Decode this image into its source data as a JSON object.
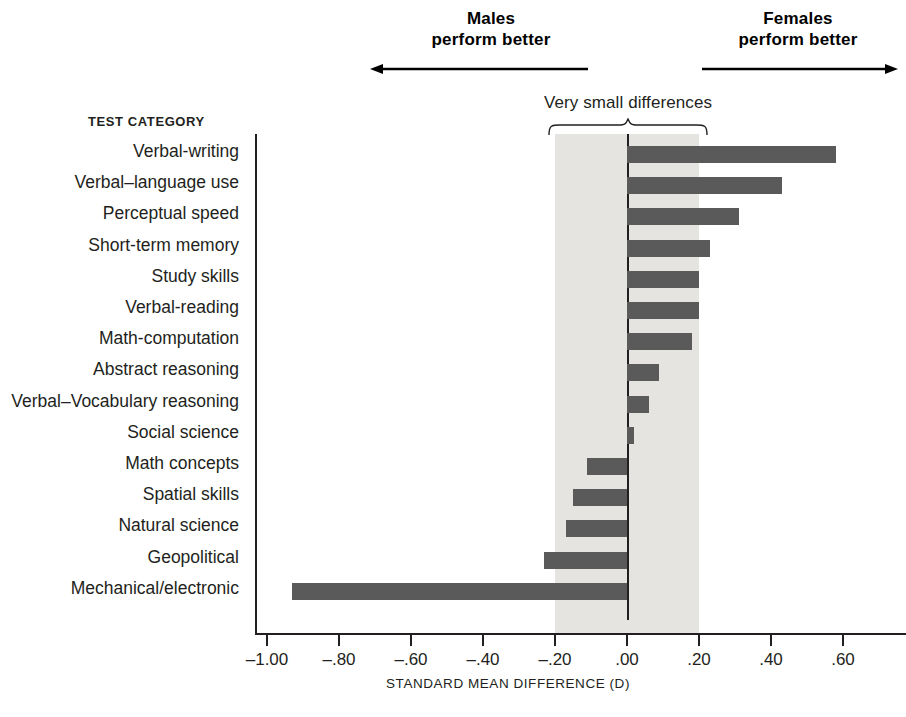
{
  "annotations": {
    "males": {
      "line1": "Males",
      "line2": "perform better",
      "arrow": "left-arrow-icon"
    },
    "females": {
      "line1": "Females",
      "line2": "perform better",
      "arrow": "right-arrow-icon"
    },
    "brace_caption": "Very small differences"
  },
  "axes": {
    "category_header": "TEST CATEGORY",
    "x_title": "STANDARD MEAN DIFFERENCE (D)",
    "x_tick_labels": [
      "–1.00",
      "–.80",
      "–.60",
      "–.40",
      "–.20",
      ".00",
      ".20",
      ".40",
      ".60"
    ]
  },
  "colors": {
    "bar": "#5a5a5a",
    "band": "#e5e4e1",
    "axis": "#231f20",
    "text": "#231f20",
    "background": "#ffffff"
  },
  "chart_data": {
    "type": "bar",
    "orientation": "horizontal",
    "title": "",
    "subtitle": "",
    "xlabel": "STANDARD MEAN DIFFERENCE (D)",
    "ylabel": "TEST CATEGORY",
    "xlim": [
      -1.05,
      0.7
    ],
    "xticks": [
      -1.0,
      -0.8,
      -0.6,
      -0.4,
      -0.2,
      0.0,
      0.2,
      0.4,
      0.6
    ],
    "xtick_labels": [
      "–1.00",
      "–.80",
      "–.60",
      "–.40",
      "–.20",
      ".00",
      ".20",
      ".40",
      ".60"
    ],
    "grid": false,
    "legend": null,
    "shaded_band": {
      "from": -0.2,
      "to": 0.2,
      "label": "Very small differences"
    },
    "annotations": [
      {
        "text": "Males perform better",
        "direction": "left",
        "side": "negative"
      },
      {
        "text": "Females perform better",
        "direction": "right",
        "side": "positive"
      }
    ],
    "categories": [
      "Verbal-writing",
      "Verbal–language use",
      "Perceptual speed",
      "Short-term memory",
      "Study skills",
      "Verbal-reading",
      "Math-computation",
      "Abstract reasoning",
      "Verbal–Vocabulary reasoning",
      "Social science",
      "Math concepts",
      "Spatial skills",
      "Natural science",
      "Geopolitical",
      "Mechanical/electronic"
    ],
    "values": [
      0.58,
      0.43,
      0.31,
      0.23,
      0.2,
      0.2,
      0.18,
      0.09,
      0.06,
      0.02,
      -0.11,
      -0.15,
      -0.17,
      -0.23,
      -0.93
    ]
  }
}
